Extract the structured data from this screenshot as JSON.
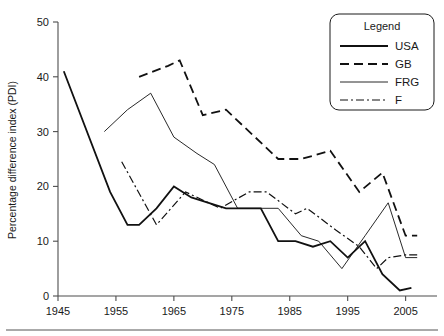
{
  "chart_data": {
    "type": "line",
    "title": "",
    "xlabel": "",
    "ylabel": "Percentage difference index (PDI)",
    "xlim": [
      1945,
      2008
    ],
    "ylim": [
      0,
      50
    ],
    "xticks": [
      1945,
      1955,
      1965,
      1975,
      1985,
      1995,
      2005
    ],
    "yticks": [
      0,
      10,
      20,
      30,
      40,
      50
    ],
    "grid": false,
    "legend_position": "top-right",
    "legend_title": "Legend",
    "series": [
      {
        "name": "USA",
        "style": "solid-thick",
        "x": [
          1946,
          1954,
          1957,
          1959,
          1962,
          1965,
          1968,
          1971,
          1974,
          1977,
          1980,
          1983,
          1986,
          1989,
          1992,
          1995,
          1998,
          2001,
          2004,
          2006
        ],
        "values": [
          41,
          19,
          13,
          13,
          16,
          20,
          18,
          17,
          16,
          16,
          16,
          10,
          10,
          9,
          10,
          7,
          10,
          4,
          1,
          1.5
        ]
      },
      {
        "name": "GB",
        "style": "dashed",
        "x": [
          1959,
          1964,
          1966,
          1970,
          1974,
          1979,
          1983,
          1987,
          1992,
          1997,
          2001,
          2005,
          2007
        ],
        "values": [
          40,
          42,
          43,
          33,
          34,
          29,
          25,
          25,
          26.5,
          19,
          22.5,
          11,
          11
        ]
      },
      {
        "name": "FRG",
        "style": "thin-solid",
        "x": [
          1953,
          1957,
          1961,
          1965,
          1969,
          1972,
          1976,
          1980,
          1983,
          1987,
          1990,
          1994,
          1998,
          2002,
          2005,
          2007
        ],
        "values": [
          30,
          34,
          37,
          29,
          26,
          24,
          16,
          16,
          16,
          11,
          10,
          5,
          11,
          17,
          7,
          7
        ]
      },
      {
        "name": "F",
        "style": "dash-dot",
        "x": [
          1956,
          1962,
          1967,
          1973,
          1978,
          1981,
          1986,
          1988,
          1993,
          1997,
          2000,
          2002,
          2005,
          2007
        ],
        "values": [
          24.5,
          13,
          19,
          16,
          19,
          19,
          15,
          16,
          12,
          9,
          5,
          7,
          7.5,
          7.5
        ]
      }
    ]
  },
  "legend": {
    "title": "Legend",
    "items": [
      {
        "label": "USA",
        "style": "solid-thick"
      },
      {
        "label": "GB",
        "style": "dashed"
      },
      {
        "label": "FRG",
        "style": "thin-solid"
      },
      {
        "label": "F",
        "style": "dash-dot"
      }
    ]
  },
  "axes": {
    "y_title": "Percentage difference index (PDI)",
    "y_tick_labels": [
      "0",
      "10",
      "20",
      "30",
      "40",
      "50"
    ],
    "x_tick_labels": [
      "1945",
      "1955",
      "1965",
      "1975",
      "1985",
      "1995",
      "2005"
    ]
  }
}
